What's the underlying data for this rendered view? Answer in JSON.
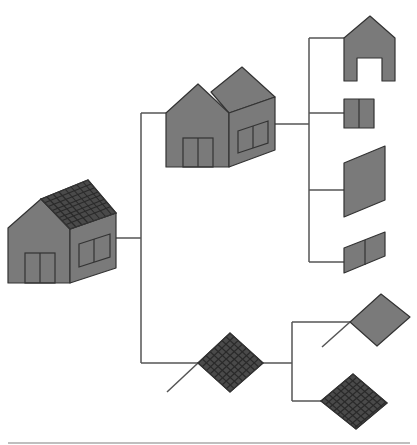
{
  "diagram": {
    "type": "hierarchy-tree",
    "colors": {
      "fill": "#7a7a7a",
      "stroke": "#333333",
      "solar_fill": "#4a4a4a",
      "connector": "#555555",
      "background": "#ffffff"
    },
    "nodes": [
      {
        "id": "house-with-solar",
        "label": "House with solar roof",
        "level": 0
      },
      {
        "id": "house-body",
        "label": "House without solar panels",
        "level": 1,
        "parent": "house-with-solar"
      },
      {
        "id": "solar-panel",
        "label": "Solar roof panel",
        "level": 1,
        "parent": "house-with-solar"
      },
      {
        "id": "front-gable-wall",
        "label": "Front gable wall with door opening",
        "level": 2,
        "parent": "house-body"
      },
      {
        "id": "door",
        "label": "Door",
        "level": 2,
        "parent": "house-body"
      },
      {
        "id": "roof-plane",
        "label": "Roof plane",
        "level": 2,
        "parent": "house-body"
      },
      {
        "id": "window-wall",
        "label": "Side wall window",
        "level": 2,
        "parent": "house-body"
      },
      {
        "id": "panel-frame",
        "label": "Panel frame",
        "level": 2,
        "parent": "solar-panel"
      },
      {
        "id": "panel-cells",
        "label": "Panel cell grid",
        "level": 2,
        "parent": "solar-panel"
      }
    ]
  }
}
